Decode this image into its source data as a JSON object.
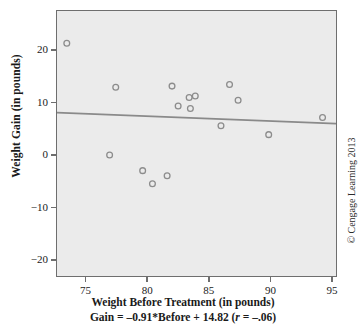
{
  "chart_data": {
    "type": "scatter",
    "title": "",
    "xlabel": "Weight Before Treatment (in pounds)",
    "ylabel": "Weight Gain (in pounds)",
    "annotation": "Gain = –0.91*Before + 14.82 (r = –.06)",
    "annotation_parts": {
      "lead": "Gain = –0.91*Before + 14.82 (",
      "r_symbol": "r",
      "tail": " = –.06)"
    },
    "xlim": [
      72.6,
      95.4
    ],
    "ylim": [
      -23.2,
      27.6
    ],
    "xticks": [
      75,
      80,
      85,
      90,
      95
    ],
    "xtick_labels": [
      "75",
      "80",
      "85",
      "90",
      "95"
    ],
    "yticks": [
      20,
      10,
      0,
      -10,
      -20
    ],
    "ytick_labels": [
      "20",
      "10",
      "0",
      "−10",
      "−20"
    ],
    "grid": false,
    "legend": null,
    "marker": "open-circle",
    "marker_color": "#8c8c8c",
    "plot_background": "#ebebeb",
    "frame_color": "#6e6e6e",
    "x": [
      73.4,
      77.4,
      82.0,
      83.4,
      83.9,
      82.5,
      83.5,
      86.7,
      87.4,
      94.3,
      86.0,
      89.9,
      76.9,
      79.6,
      81.6,
      80.4
    ],
    "y": [
      21.4,
      13.0,
      13.2,
      11.0,
      11.3,
      9.4,
      8.9,
      13.5,
      10.5,
      7.2,
      5.6,
      3.9,
      0.0,
      -3.0,
      -4.0,
      -5.5
    ],
    "points": [
      {
        "x": 73.4,
        "y": 21.4
      },
      {
        "x": 77.4,
        "y": 13.0
      },
      {
        "x": 82.0,
        "y": 13.2
      },
      {
        "x": 83.4,
        "y": 11.0
      },
      {
        "x": 83.9,
        "y": 11.3
      },
      {
        "x": 82.5,
        "y": 9.4
      },
      {
        "x": 83.5,
        "y": 8.9
      },
      {
        "x": 86.7,
        "y": 13.5
      },
      {
        "x": 87.4,
        "y": 10.5
      },
      {
        "x": 94.3,
        "y": 7.2
      },
      {
        "x": 86.0,
        "y": 5.6
      },
      {
        "x": 89.9,
        "y": 3.9
      },
      {
        "x": 76.9,
        "y": 0.0
      },
      {
        "x": 79.6,
        "y": -3.0
      },
      {
        "x": 81.6,
        "y": -4.0
      },
      {
        "x": 80.4,
        "y": -5.5
      }
    ],
    "regression_line": {
      "slope": -0.091,
      "intercept": 14.82,
      "correlation": -0.06,
      "color": "#8a8a8a",
      "x_start": 72.6,
      "x_end": 95.4,
      "y_start": 8.1,
      "y_end": 6.0
    }
  },
  "credit": {
    "text": "© Cengage Learning 2013"
  }
}
